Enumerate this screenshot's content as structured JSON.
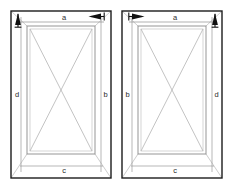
{
  "drawing": {
    "title": "Two-panel window elevation with dimension callouts",
    "canvas": {
      "width": 234,
      "height": 187,
      "background": "#ffffff"
    },
    "colors": {
      "outer_frame": "#1c1c1c",
      "sash_frame": "#8a8a8a",
      "glazing_diagonal": "#b4b4b4",
      "miter_line": "#b0b0b0",
      "dimension_line": "#1c1c1c",
      "arrow_fill": "#111111",
      "label_text": "#2b2b2b"
    },
    "panels": [
      {
        "id": "left-panel",
        "name": "Left window panel",
        "outer": {
          "x": 11,
          "y": 11,
          "width": 100,
          "height": 167
        },
        "sash": {
          "x": 27,
          "y": 26,
          "width": 68,
          "height": 128
        },
        "labels": {
          "top": {
            "text": "a",
            "x": 64,
            "y": 18
          },
          "bottom": {
            "text": "c",
            "x": 64,
            "y": 171
          },
          "left": {
            "text": "d",
            "x": 17,
            "y": 95
          },
          "right": {
            "text": "b",
            "x": 105,
            "y": 95
          }
        },
        "arrows": [
          {
            "name": "top-left-up-arrow",
            "direction": "up",
            "x": 18,
            "y": 14
          },
          {
            "name": "top-right-left-arrow",
            "direction": "left",
            "x": 103,
            "y": 16
          }
        ]
      },
      {
        "id": "right-panel",
        "name": "Right window panel",
        "outer": {
          "x": 122,
          "y": 11,
          "width": 100,
          "height": 167
        },
        "sash": {
          "x": 138,
          "y": 26,
          "width": 68,
          "height": 128
        },
        "labels": {
          "top": {
            "text": "a",
            "x": 175,
            "y": 18
          },
          "bottom": {
            "text": "c",
            "x": 175,
            "y": 171
          },
          "left": {
            "text": "b",
            "x": 128,
            "y": 95
          },
          "right": {
            "text": "d",
            "x": 216,
            "y": 95
          }
        },
        "arrows": [
          {
            "name": "top-left-right-arrow",
            "direction": "right",
            "x": 130,
            "y": 16
          },
          {
            "name": "top-right-up-arrow",
            "direction": "up",
            "x": 215,
            "y": 14
          }
        ]
      }
    ],
    "legend": {
      "dimension_a": "a",
      "dimension_b": "b",
      "dimension_c": "c",
      "dimension_d": "d"
    }
  }
}
